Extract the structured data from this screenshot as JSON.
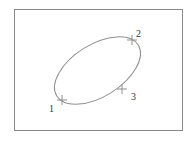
{
  "diagram": {
    "type": "ellipse-with-points",
    "frame": {
      "border_color": "#8a8a8a"
    },
    "ellipse": {
      "cx": 97.5,
      "cy": 70.5,
      "rx": 48,
      "ry": 26,
      "rotation_deg": -32,
      "stroke": "#8f8f8f"
    },
    "points": [
      {
        "label": "1",
        "x": 62,
        "y": 100,
        "label_x": 49,
        "label_y": 112
      },
      {
        "label": "2",
        "x": 132,
        "y": 40,
        "label_x": 136,
        "label_y": 37
      },
      {
        "label": "3",
        "x": 122,
        "y": 89,
        "label_x": 131,
        "label_y": 100
      }
    ],
    "marker": {
      "type": "cross",
      "color": "#8f8f8f"
    }
  }
}
